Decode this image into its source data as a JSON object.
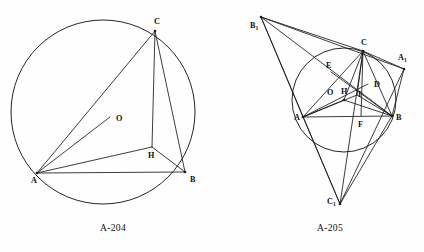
{
  "page": {
    "width": 424,
    "height": 252,
    "background": "#fefefe",
    "ink_color": "#1a1a1a"
  },
  "figures": [
    {
      "id": "fig-a204",
      "caption": "A-204",
      "caption_pos": {
        "x": 113,
        "y": 231
      },
      "description": "Triangle ABC inscribed in a circle with circumcenter O and orthocenter-related point H",
      "circle": {
        "cx": 103,
        "cy": 112,
        "r": 92
      },
      "points": [
        {
          "name": "A",
          "x": 37,
          "y": 173,
          "label": "A",
          "sub": "",
          "lx": 31,
          "ly": 183,
          "dot": true
        },
        {
          "name": "B",
          "x": 185,
          "y": 172,
          "label": "B",
          "sub": "",
          "lx": 190,
          "ly": 182,
          "dot": true
        },
        {
          "name": "C",
          "x": 155,
          "y": 31,
          "label": "C",
          "sub": "",
          "lx": 154,
          "ly": 24,
          "dot": true
        },
        {
          "name": "H",
          "x": 152,
          "y": 147,
          "label": "H",
          "sub": "",
          "lx": 148,
          "ly": 158,
          "dot": false
        },
        {
          "name": "O",
          "x": 110,
          "y": 117,
          "label": "O",
          "sub": "",
          "lx": 116,
          "ly": 121,
          "dot": false
        }
      ],
      "segments": [
        {
          "from": "A",
          "to": "B"
        },
        {
          "from": "A",
          "to": "C"
        },
        {
          "from": "B",
          "to": "C"
        },
        {
          "from": "A",
          "to": "H"
        },
        {
          "from": "B",
          "to": "H"
        },
        {
          "from": "C",
          "to": "H"
        },
        {
          "from": "A",
          "to": "O"
        }
      ]
    },
    {
      "id": "fig-a205",
      "caption": "A-205",
      "caption_pos": {
        "x": 330,
        "y": 231
      },
      "description": "Triangle ABC with circumcircle, circumcenter O, orthocenter H, incenter I, and tangential triangle A1 B1 C1",
      "circle": {
        "cx": 344,
        "cy": 100,
        "r": 52
      },
      "points": [
        {
          "name": "A",
          "x": 303,
          "y": 117,
          "label": "A",
          "sub": "",
          "lx": 294,
          "ly": 120,
          "dot": true
        },
        {
          "name": "B",
          "x": 392,
          "y": 116,
          "label": "B",
          "sub": "",
          "lx": 396,
          "ly": 120,
          "dot": true
        },
        {
          "name": "C",
          "x": 363,
          "y": 51,
          "label": "C",
          "sub": "",
          "lx": 361,
          "ly": 45,
          "dot": true
        },
        {
          "name": "A1",
          "x": 404,
          "y": 69,
          "label": "A",
          "sub": "1",
          "lx": 398,
          "ly": 60,
          "dot": true
        },
        {
          "name": "B1",
          "x": 261,
          "y": 17,
          "label": "B",
          "sub": "1",
          "lx": 250,
          "ly": 28,
          "dot": true
        },
        {
          "name": "C1",
          "x": 340,
          "y": 204,
          "label": "C",
          "sub": "1",
          "lx": 327,
          "ly": 204,
          "dot": true
        },
        {
          "name": "D",
          "x": 368,
          "y": 84,
          "label": "D",
          "sub": "",
          "lx": 374,
          "ly": 87,
          "dot": false
        },
        {
          "name": "E",
          "x": 331,
          "y": 72,
          "label": "E",
          "sub": "",
          "lx": 326,
          "ly": 68,
          "dot": false
        },
        {
          "name": "F",
          "x": 361,
          "y": 116,
          "label": "F",
          "sub": "",
          "lx": 358,
          "ly": 127,
          "dot": false
        },
        {
          "name": "H",
          "x": 352,
          "y": 92,
          "label": "H",
          "sub": "",
          "lx": 341,
          "ly": 94,
          "dot": false
        },
        {
          "name": "I",
          "x": 357,
          "y": 95,
          "label": "I",
          "sub": "",
          "lx": 358,
          "ly": 97,
          "dot": false
        },
        {
          "name": "O",
          "x": 344,
          "y": 100,
          "label": "O",
          "sub": "",
          "lx": 327,
          "ly": 95,
          "dot": true
        }
      ],
      "segments": [
        {
          "from": "A",
          "to": "B"
        },
        {
          "from": "B",
          "to": "C"
        },
        {
          "from": "C",
          "to": "A"
        },
        {
          "from": "A1",
          "to": "B1"
        },
        {
          "from": "B1",
          "to": "C1"
        },
        {
          "from": "C1",
          "to": "A1"
        },
        {
          "from": "A",
          "to": "D"
        },
        {
          "from": "B",
          "to": "E"
        },
        {
          "from": "C",
          "to": "F"
        },
        {
          "from": "A",
          "to": "O"
        },
        {
          "from": "B",
          "to": "O"
        },
        {
          "from": "C",
          "to": "O"
        },
        {
          "from": "A",
          "to": "I"
        },
        {
          "from": "B",
          "to": "I"
        },
        {
          "from": "C",
          "to": "I"
        },
        {
          "from": "B1",
          "to": "A"
        },
        {
          "from": "B1",
          "to": "C"
        },
        {
          "from": "B1",
          "to": "B"
        },
        {
          "from": "C1",
          "to": "A"
        },
        {
          "from": "C1",
          "to": "B"
        },
        {
          "from": "C1",
          "to": "C"
        },
        {
          "from": "A1",
          "to": "C"
        },
        {
          "from": "A1",
          "to": "B"
        }
      ]
    }
  ]
}
